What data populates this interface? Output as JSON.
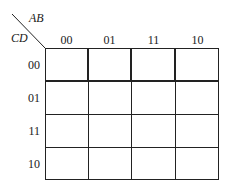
{
  "kmap": {
    "row_variables": "CD",
    "column_variables": "AB",
    "columns": [
      "00",
      "01",
      "11",
      "10"
    ],
    "rows": [
      "00",
      "01",
      "11",
      "10"
    ],
    "cells": [
      [
        "",
        "",
        "",
        ""
      ],
      [
        "",
        "",
        "",
        ""
      ],
      [
        "",
        "",
        "",
        ""
      ],
      [
        "",
        "",
        "",
        ""
      ]
    ]
  }
}
